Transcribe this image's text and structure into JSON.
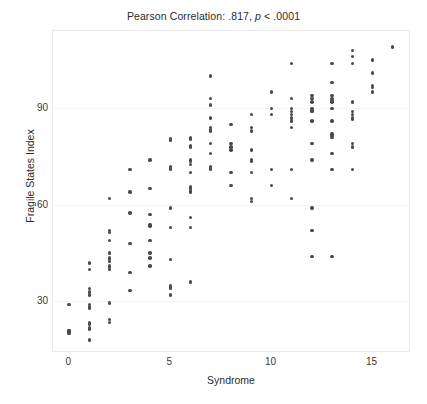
{
  "chart_data": {
    "type": "scatter",
    "title": "Pearson Correlation: .817, p < .0001",
    "title_prefix": "Pearson Correlation: .817,",
    "title_italic": "p",
    "title_suffix": "< .0001",
    "xlabel": "Syndrome",
    "ylabel": "Fragile States Index",
    "xlim": [
      -0.8,
      16.9
    ],
    "ylim": [
      14,
      114
    ],
    "xticks": [
      0,
      5,
      10,
      15
    ],
    "xtick_labels": [
      "0",
      "5",
      "10",
      "15"
    ],
    "yticks": [
      30,
      60,
      90
    ],
    "ytick_labels": [
      "30",
      "60",
      "90"
    ],
    "grid": false,
    "legend": false,
    "marker_color": "#4a4a4a",
    "frame_color": "#e9e9e9",
    "statistics": {
      "pearson_r": ".817",
      "p_value": "< .0001"
    },
    "points": [
      [
        0,
        29
      ],
      [
        0,
        21
      ],
      [
        0,
        21
      ],
      [
        0,
        20.5
      ],
      [
        0,
        20
      ],
      [
        1,
        42
      ],
      [
        1,
        40
      ],
      [
        1,
        34
      ],
      [
        1,
        33
      ],
      [
        1,
        32
      ],
      [
        1,
        29
      ],
      [
        1,
        28.5
      ],
      [
        1,
        28
      ],
      [
        1,
        23.5
      ],
      [
        1,
        23
      ],
      [
        1,
        22
      ],
      [
        1,
        21.5
      ],
      [
        1,
        18
      ],
      [
        2,
        62
      ],
      [
        2,
        52
      ],
      [
        2,
        51.5
      ],
      [
        2,
        49
      ],
      [
        2,
        45
      ],
      [
        2,
        43.5
      ],
      [
        2,
        43
      ],
      [
        2,
        42.5
      ],
      [
        2,
        41
      ],
      [
        2,
        40.5
      ],
      [
        2,
        40
      ],
      [
        2,
        29.5
      ],
      [
        2,
        24.5
      ],
      [
        2,
        23.5
      ],
      [
        3,
        71
      ],
      [
        3,
        64
      ],
      [
        3,
        57.5
      ],
      [
        3,
        48
      ],
      [
        3,
        39
      ],
      [
        3,
        33.5
      ],
      [
        4,
        74
      ],
      [
        4,
        65
      ],
      [
        4,
        57
      ],
      [
        4,
        54
      ],
      [
        4,
        53.5
      ],
      [
        4,
        49
      ],
      [
        4,
        45
      ],
      [
        4,
        43.5
      ],
      [
        4,
        41
      ],
      [
        5,
        80.5
      ],
      [
        5,
        80
      ],
      [
        5,
        72
      ],
      [
        5,
        71.5
      ],
      [
        5,
        71
      ],
      [
        5,
        59
      ],
      [
        5,
        53
      ],
      [
        5,
        43
      ],
      [
        5,
        35
      ],
      [
        5,
        34.5
      ],
      [
        5,
        34
      ],
      [
        5,
        32
      ],
      [
        6,
        81
      ],
      [
        6,
        80.5
      ],
      [
        6,
        78.5
      ],
      [
        6,
        78
      ],
      [
        6,
        74
      ],
      [
        6,
        73.5
      ],
      [
        6,
        72.5
      ],
      [
        6,
        70
      ],
      [
        6,
        65.5
      ],
      [
        6,
        65
      ],
      [
        6,
        64.5
      ],
      [
        6,
        64
      ],
      [
        6,
        56
      ],
      [
        6,
        53
      ],
      [
        6,
        36
      ],
      [
        7,
        100
      ],
      [
        7,
        93
      ],
      [
        7,
        91
      ],
      [
        7,
        87
      ],
      [
        7,
        84
      ],
      [
        7,
        83.5
      ],
      [
        7,
        83
      ],
      [
        7,
        79
      ],
      [
        7,
        76
      ],
      [
        7,
        72
      ],
      [
        7,
        71.5
      ],
      [
        7,
        71
      ],
      [
        8,
        85
      ],
      [
        8,
        79
      ],
      [
        8,
        78
      ],
      [
        8,
        77
      ],
      [
        8,
        70
      ],
      [
        8,
        66
      ],
      [
        9,
        88
      ],
      [
        9,
        84
      ],
      [
        9,
        83
      ],
      [
        9,
        77
      ],
      [
        9,
        74
      ],
      [
        9,
        73.5
      ],
      [
        9,
        70
      ],
      [
        9,
        62
      ],
      [
        9,
        61
      ],
      [
        10,
        95
      ],
      [
        10,
        90
      ],
      [
        10,
        88
      ],
      [
        10,
        71
      ],
      [
        10,
        66
      ],
      [
        11,
        104
      ],
      [
        11,
        93
      ],
      [
        11,
        90
      ],
      [
        11,
        89
      ],
      [
        11,
        88
      ],
      [
        11,
        87
      ],
      [
        11,
        86
      ],
      [
        11,
        84
      ],
      [
        11,
        71
      ],
      [
        11,
        62
      ],
      [
        12,
        94
      ],
      [
        12,
        93
      ],
      [
        12,
        92
      ],
      [
        12,
        90
      ],
      [
        12,
        89.5
      ],
      [
        12,
        89
      ],
      [
        12,
        86
      ],
      [
        12,
        79
      ],
      [
        12,
        74
      ],
      [
        12,
        59
      ],
      [
        12,
        52
      ],
      [
        12,
        44
      ],
      [
        13,
        104
      ],
      [
        13,
        98
      ],
      [
        13,
        94
      ],
      [
        13,
        93
      ],
      [
        13,
        92.5
      ],
      [
        13,
        92
      ],
      [
        13,
        90
      ],
      [
        13,
        86
      ],
      [
        13,
        82
      ],
      [
        13,
        81.5
      ],
      [
        13,
        81
      ],
      [
        13,
        76
      ],
      [
        13,
        71
      ],
      [
        13,
        44
      ],
      [
        14,
        108
      ],
      [
        14,
        106
      ],
      [
        14,
        104
      ],
      [
        14,
        92
      ],
      [
        14,
        89
      ],
      [
        14,
        88
      ],
      [
        14,
        87
      ],
      [
        14,
        86.5
      ],
      [
        14,
        79
      ],
      [
        14,
        78
      ],
      [
        14,
        71
      ],
      [
        15,
        105
      ],
      [
        15,
        101
      ],
      [
        15,
        97
      ],
      [
        15,
        96.5
      ],
      [
        15,
        95
      ],
      [
        16,
        109
      ]
    ]
  }
}
